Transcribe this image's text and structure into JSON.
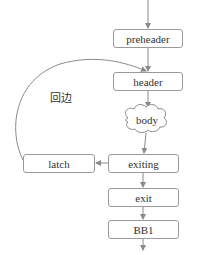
{
  "diagram": {
    "type": "control-flow-graph",
    "colors": {
      "stroke": "#8a8a8a",
      "text": "#333333",
      "background": "#ffffff"
    },
    "nodes": {
      "preheader": {
        "label": "preheader",
        "shape": "rounded-rect"
      },
      "header": {
        "label": "header",
        "shape": "rounded-rect"
      },
      "body": {
        "label": "body",
        "shape": "cloud"
      },
      "exiting": {
        "label": "exiting",
        "shape": "rounded-rect"
      },
      "latch": {
        "label": "latch",
        "shape": "rounded-rect"
      },
      "exit": {
        "label": "exit",
        "shape": "rounded-rect"
      },
      "bb1": {
        "label": "BB1",
        "shape": "rounded-rect"
      }
    },
    "edges": [
      {
        "from": "(entry)",
        "to": "preheader"
      },
      {
        "from": "preheader",
        "to": "header"
      },
      {
        "from": "header",
        "to": "body"
      },
      {
        "from": "body",
        "to": "exiting"
      },
      {
        "from": "exiting",
        "to": "latch"
      },
      {
        "from": "latch",
        "to": "header",
        "label": "回边"
      },
      {
        "from": "exiting",
        "to": "exit"
      },
      {
        "from": "exit",
        "to": "bb1"
      },
      {
        "from": "bb1",
        "to": "(continue)"
      }
    ],
    "back_edge_label": "回边"
  }
}
